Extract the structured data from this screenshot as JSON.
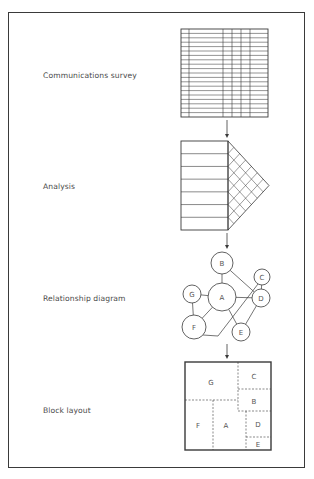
{
  "stages": [
    {
      "label": "Communications survey",
      "y": 75
    },
    {
      "label": "Analysis",
      "y": 186
    },
    {
      "label": "Relationship diagram",
      "y": 298
    },
    {
      "label": "Block layout",
      "y": 410
    }
  ],
  "survey_grid": {
    "x": 181,
    "y": 29,
    "width": 87,
    "height": 88,
    "rows": 20,
    "column_lines_x": [
      189,
      223,
      232,
      241,
      250
    ]
  },
  "analysis": {
    "rect": {
      "x": 181,
      "y": 141,
      "width": 47,
      "height": 89
    },
    "rows": 7,
    "apex": {
      "x": 269,
      "y": 185.5
    },
    "hatch_cells": 7
  },
  "relationship_diagram": {
    "nodes": [
      {
        "id": "B",
        "x": 222,
        "y": 263,
        "r": 11
      },
      {
        "id": "A",
        "x": 222,
        "y": 297,
        "r": 14
      },
      {
        "id": "C",
        "x": 262,
        "y": 277,
        "r": 8
      },
      {
        "id": "D",
        "x": 261,
        "y": 298,
        "r": 9
      },
      {
        "id": "G",
        "x": 192,
        "y": 294,
        "r": 9
      },
      {
        "id": "F",
        "x": 194,
        "y": 327,
        "r": 12
      },
      {
        "id": "E",
        "x": 241,
        "y": 332,
        "r": 9
      }
    ],
    "edges": [
      [
        "B",
        "A"
      ],
      [
        "B",
        "D"
      ],
      [
        "G",
        "A"
      ],
      [
        "A",
        "D"
      ],
      [
        "G",
        "F"
      ],
      [
        "A",
        "F"
      ],
      [
        "A",
        "E"
      ],
      [
        "E",
        "D"
      ],
      [
        "C",
        "D"
      ]
    ],
    "path_F_to_C": [
      [
        203,
        335
      ],
      [
        218,
        336
      ],
      [
        258,
        284
      ]
    ]
  },
  "block_layout": {
    "rect": {
      "x": 185,
      "y": 362,
      "width": 86,
      "height": 88
    },
    "blocks": [
      {
        "id": "G",
        "x": 211,
        "y": 382
      },
      {
        "id": "C",
        "x": 254,
        "y": 376
      },
      {
        "id": "B",
        "x": 254,
        "y": 401
      },
      {
        "id": "F",
        "x": 198,
        "y": 425
      },
      {
        "id": "A",
        "x": 226,
        "y": 425
      },
      {
        "id": "D",
        "x": 258,
        "y": 424
      },
      {
        "id": "E",
        "x": 258,
        "y": 444
      }
    ],
    "dividers": [
      [
        238,
        362,
        238,
        411
      ],
      [
        238,
        389,
        271,
        389
      ],
      [
        185,
        400,
        238,
        400
      ],
      [
        213,
        400,
        213,
        450
      ],
      [
        238,
        411,
        271,
        411
      ],
      [
        246,
        411,
        246,
        450
      ],
      [
        246,
        437,
        271,
        437
      ]
    ]
  },
  "arrows": [
    {
      "x": 227,
      "y1": 120,
      "y2": 138
    },
    {
      "x": 227,
      "y1": 233,
      "y2": 249
    },
    {
      "x": 227,
      "y1": 344,
      "y2": 359
    }
  ],
  "colors": {
    "line": "#3a3a3a",
    "text": "#4a4a4a"
  }
}
